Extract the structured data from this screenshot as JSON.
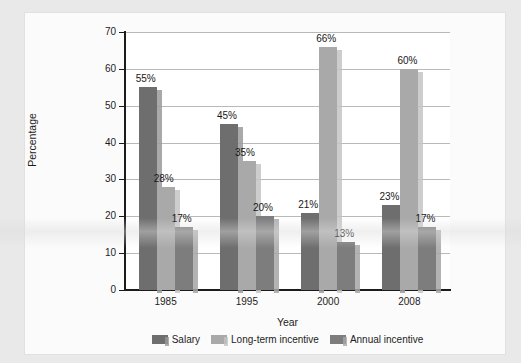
{
  "chart_data": {
    "type": "bar",
    "title": "",
    "xlabel": "Year",
    "ylabel": "Percentage",
    "categories": [
      "1985",
      "1995",
      "2000",
      "2008"
    ],
    "ylim": [
      0,
      70
    ],
    "yticks": [
      0,
      10,
      20,
      30,
      40,
      50,
      60,
      70
    ],
    "ytick_labels": [
      "0",
      "10",
      "20",
      "30",
      "40",
      "50",
      "60",
      "70"
    ],
    "grid": true,
    "legend_position": "bottom",
    "series": [
      {
        "name": "Salary",
        "color": "#6e6e6e",
        "shadow_color": "#9a9a9a",
        "values": [
          55,
          45,
          21,
          23
        ],
        "labels": [
          "55%",
          "45%",
          "21%",
          "23%"
        ]
      },
      {
        "name": "Long-term incentive",
        "color": "#a9a9a9",
        "shadow_color": "#c4c4c4",
        "values": [
          28,
          35,
          66,
          60
        ],
        "labels": [
          "28%",
          "35%",
          "66%",
          "60%"
        ]
      },
      {
        "name": "Annual incentive",
        "color": "#7d7d7d",
        "shadow_color": "#a6a6a6",
        "values": [
          17,
          20,
          13,
          17
        ],
        "labels": [
          "17%",
          "20%",
          "13%",
          "17%"
        ]
      }
    ]
  }
}
